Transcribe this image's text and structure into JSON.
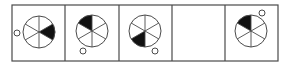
{
  "puzzle": {
    "type": "figure-sequence",
    "panel_count": 5,
    "blank_panel_index": 3,
    "colors": {
      "stroke": "#4a4a4a",
      "fill_shaded": "#111111",
      "background": "#ffffff"
    },
    "frame": {
      "x": 12,
      "y": 5,
      "width": 266,
      "height": 56
    },
    "dividers_x": [
      65,
      119,
      172,
      225
    ],
    "panels": [
      {
        "index": 1,
        "circle": {
          "cx": 39,
          "cy": 32,
          "r": 16
        },
        "shaded_sector": "right",
        "dot": {
          "cx": 17,
          "cy": 33,
          "r": 3,
          "position": "left"
        }
      },
      {
        "index": 2,
        "circle": {
          "cx": 92,
          "cy": 31,
          "r": 16
        },
        "shaded_sector": "top-left",
        "dot": {
          "cx": 83,
          "cy": 51,
          "r": 3,
          "position": "bottom-left"
        }
      },
      {
        "index": 3,
        "circle": {
          "cx": 145,
          "cy": 31,
          "r": 16
        },
        "shaded_sector": "bottom-left",
        "dot": {
          "cx": 155,
          "cy": 51,
          "r": 3,
          "position": "bottom-right"
        }
      },
      {
        "index": 4,
        "empty": true
      },
      {
        "index": 5,
        "circle": {
          "cx": 251,
          "cy": 31,
          "r": 16
        },
        "shaded_sector": "top-left",
        "dot": {
          "cx": 262,
          "cy": 13,
          "r": 3,
          "position": "top-right"
        }
      }
    ]
  }
}
